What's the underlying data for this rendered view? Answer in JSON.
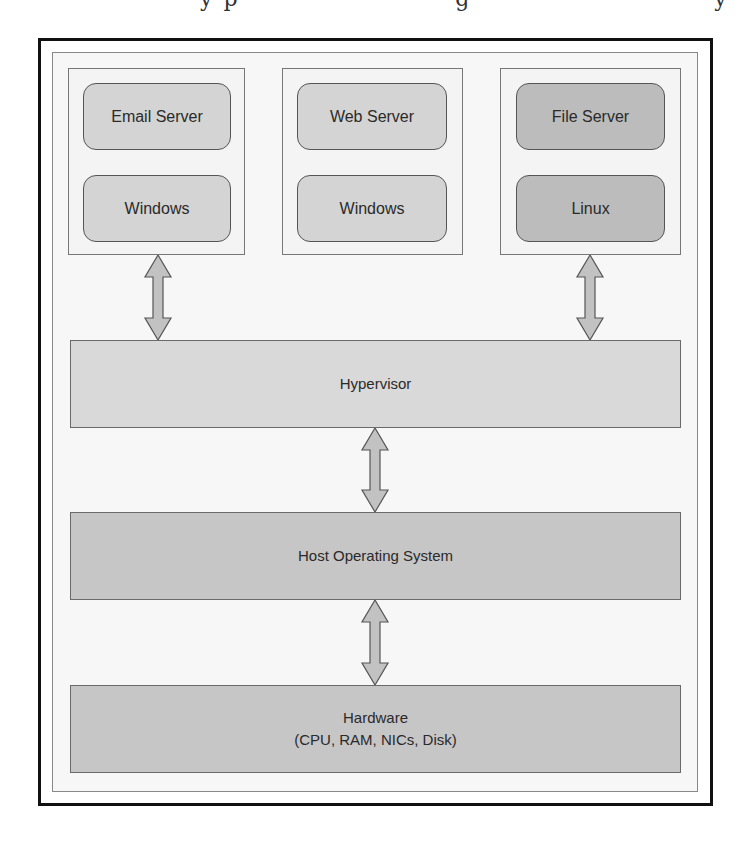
{
  "diagram": {
    "colors": {
      "outer_border": "#111111",
      "inner_border": "#888888",
      "vm_frame_bg": "#f4f4f4",
      "vm_light_fill": "#d4d4d4",
      "vm_dark_fill": "#bcbcbc",
      "hypervisor_fill": "#d9d9d9",
      "host_os_fill": "#c6c6c6",
      "hardware_fill": "#c6c6c6",
      "arrow_fill": "#c2c2c2"
    },
    "virtual_machines": [
      {
        "application": "Email Server",
        "os": "Windows",
        "shade": "light",
        "connected_to_hypervisor": true
      },
      {
        "application": "Web Server",
        "os": "Windows",
        "shade": "light",
        "connected_to_hypervisor": false
      },
      {
        "application": "File Server",
        "os": "Linux",
        "shade": "dark",
        "connected_to_hypervisor": true
      }
    ],
    "layers": {
      "hypervisor": {
        "label": "Hypervisor"
      },
      "host_os": {
        "label": "Host Operating System"
      },
      "hardware": {
        "label": "Hardware",
        "sublabel": "(CPU, RAM, NICs, Disk)"
      }
    },
    "connections": [
      {
        "from": "Email Server VM",
        "to": "Hypervisor",
        "type": "bidirectional"
      },
      {
        "from": "File Server VM",
        "to": "Hypervisor",
        "type": "bidirectional"
      },
      {
        "from": "Hypervisor",
        "to": "Host Operating System",
        "type": "bidirectional"
      },
      {
        "from": "Host Operating System",
        "to": "Hardware",
        "type": "bidirectional"
      }
    ]
  }
}
